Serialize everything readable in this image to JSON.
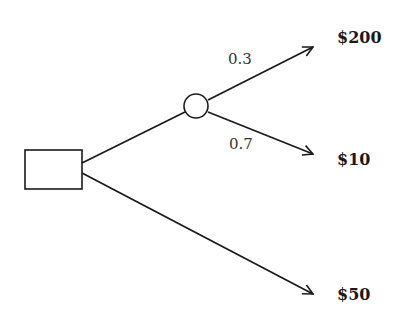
{
  "diagram": {
    "type": "decision-tree",
    "decision_node": {
      "shape": "square"
    },
    "chance_node": {
      "shape": "circle"
    },
    "branches": [
      {
        "from": "chance",
        "probability": "0.3",
        "payoff": "$200"
      },
      {
        "from": "chance",
        "probability": "0.7",
        "payoff": "$10"
      },
      {
        "from": "decision",
        "payoff": "$50"
      }
    ],
    "colors": {
      "stroke": "#1a1a1a",
      "fill": "#ffffff"
    }
  }
}
